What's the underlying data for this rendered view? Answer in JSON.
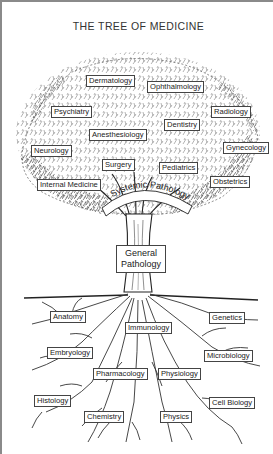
{
  "diagram": {
    "title": "THE TREE OF MEDICINE",
    "crown": {
      "labels": {
        "dermatology": "Dermatology",
        "ophthalmology": "Ophthalmology",
        "psychiatry": "Psychiatry",
        "radiology": "Radiology",
        "dentistry": "Dentistry",
        "anesthesiology": "Anesthesiology",
        "neurology": "Neurology",
        "gynecology": "Gynecology",
        "surgery": "Surgery",
        "pediatrics": "Pediatrics",
        "internal_medicine": "Internal Medicine",
        "obstetrics": "Obstetrics"
      },
      "band_label": "Systemic Pathology"
    },
    "trunk": {
      "label_line1": "General",
      "label_line2": "Pathology"
    },
    "roots": {
      "labels": {
        "anatomy": "Anatomy",
        "genetics": "Genetics",
        "immunology": "Immunology",
        "embryology": "Embryology",
        "microbiology": "Microbiology",
        "pharmacology": "Pharmacology",
        "physiology": "Physiology",
        "histology": "Histology",
        "cell_biology": "Cell Biology",
        "chemistry": "Chemistry",
        "physics": "Physics"
      }
    },
    "colors": {
      "ink": "#222222",
      "frame": "#8a8a8a",
      "background": "#ffffff"
    }
  }
}
